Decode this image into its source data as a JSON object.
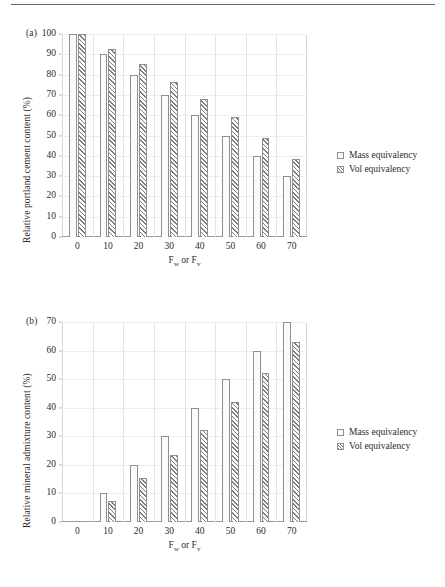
{
  "figure": {
    "rule_top": true,
    "panels": [
      {
        "tag": "(a)",
        "ylabel": "Relative portland cement content (%)",
        "xlabel_main": "F",
        "xlabel_sub1": "w",
        "xlabel_mid": " or F",
        "xlabel_sub2": "v"
      },
      {
        "tag": "(b)",
        "ylabel": "Relative mineral admixture content (%)",
        "xlabel_main": "F",
        "xlabel_sub1": "w",
        "xlabel_mid": " or F",
        "xlabel_sub2": "v"
      }
    ]
  },
  "legend": {
    "position": "right",
    "items": [
      {
        "label": "Mass equivalency",
        "swatch": "open-square"
      },
      {
        "label": "Vol equivalency",
        "swatch": "hatched-square"
      }
    ]
  },
  "colors": {
    "mass_fill": "#fbfbfb",
    "vol_hatch": "#7d7d7d",
    "bar_outline": "#8f8f8f",
    "gridline": "#ededed",
    "axis": "#9a9a9a",
    "text": "#2b2b2b"
  },
  "chart_data": [
    {
      "type": "bar",
      "title": "(a)",
      "xlabel": "Fw or Fv",
      "ylabel": "Relative portland cement content (%)",
      "categories": [
        "0",
        "10",
        "20",
        "30",
        "40",
        "50",
        "60",
        "70"
      ],
      "ylim": [
        0,
        100
      ],
      "yticks": [
        0,
        10,
        20,
        30,
        40,
        50,
        60,
        70,
        80,
        90,
        100
      ],
      "grid": true,
      "legend_position": "right",
      "series": [
        {
          "name": "Mass equivalency",
          "values": [
            100,
            90,
            80,
            70,
            60,
            50,
            40,
            30
          ]
        },
        {
          "name": "Vol equivalency",
          "values": [
            100,
            92.7,
            85,
            76.5,
            68,
            59,
            49,
            38.3
          ]
        }
      ]
    },
    {
      "type": "bar",
      "title": "(b)",
      "xlabel": "Fw or Fv",
      "ylabel": "Relative mineral admixture content (%)",
      "categories": [
        "0",
        "10",
        "20",
        "30",
        "40",
        "50",
        "60",
        "70"
      ],
      "ylim": [
        0,
        70
      ],
      "yticks": [
        0,
        10,
        20,
        30,
        40,
        50,
        60,
        70
      ],
      "grid": true,
      "legend_position": "right",
      "series": [
        {
          "name": "Mass equivalency",
          "values": [
            0,
            10,
            20,
            30,
            40,
            50,
            60,
            70
          ]
        },
        {
          "name": "Vol equivalency",
          "values": [
            0,
            7.3,
            15.3,
            23.5,
            32.3,
            42,
            52,
            63
          ]
        }
      ]
    }
  ]
}
